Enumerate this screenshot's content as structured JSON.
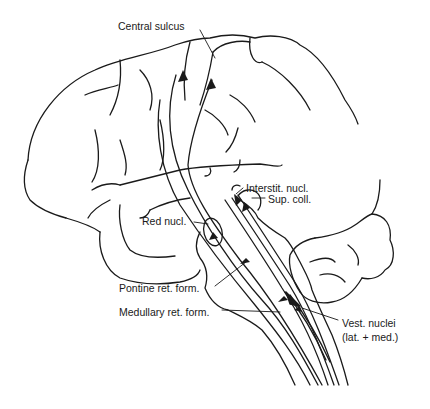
{
  "figure": {
    "type": "diagram",
    "line_color": "#1a1a1a",
    "background": "#ffffff"
  },
  "labels": {
    "central_sulcus": "Central sulcus",
    "interstit_nucl": "Interstit. nucl.",
    "sup_coll": "Sup. coll.",
    "red_nucl": "Red nucl.",
    "pontine_ret_form": "Pontine ret. form.",
    "medullary_ret_form": "Medullary ret. form.",
    "vest_nuclei_line1": "Vest. nuclei",
    "vest_nuclei_line2": "(lat. + med.)"
  }
}
